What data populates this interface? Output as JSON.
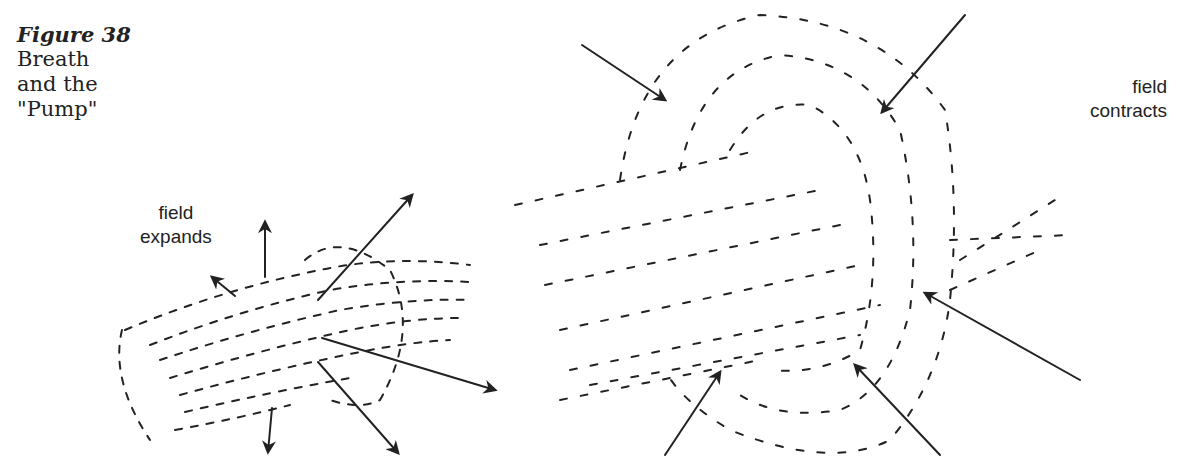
{
  "caption": {
    "figure": "Figure 38",
    "line1": "Breath",
    "line2": "and the",
    "line3": "\"Pump\""
  },
  "labels": {
    "expands": {
      "line1": "field",
      "line2": "expands"
    },
    "contracts": {
      "line1": "field",
      "line2": "contracts"
    }
  },
  "figures": [
    {
      "name": "expanding-field",
      "description": "dashed elongated field with arrows pointing outward"
    },
    {
      "name": "contracting-field",
      "description": "dashed field loops with arrows pointing inward"
    }
  ],
  "colors": {
    "ink": "#222222",
    "background": "#ffffff"
  }
}
